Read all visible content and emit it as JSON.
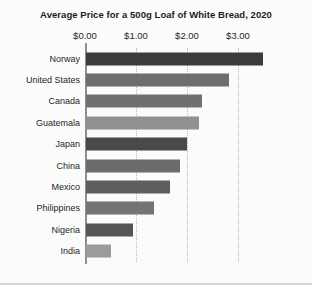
{
  "chart": {
    "title": "Average Price for a 500g Loaf of White Bread, 2020",
    "currency_prefix": "$"
  },
  "chart_data": {
    "type": "bar",
    "orientation": "horizontal",
    "title": "Average Price for a 500g Loaf of White Bread, 2020",
    "subtitle": "",
    "xlabel": "",
    "ylabel": "",
    "xlim": [
      0,
      3.5
    ],
    "xticks": [
      0,
      1,
      2,
      3
    ],
    "xtick_labels": [
      "$0.00",
      "$1.00",
      "$2.00",
      "$3.00"
    ],
    "grid": "vertical-dotted",
    "legend": "none",
    "categories": [
      "Norway",
      "United States",
      "Canada",
      "Guatemala",
      "Japan",
      "China",
      "Mexico",
      "Philippines",
      "Nigeria",
      "India"
    ],
    "values": [
      3.47,
      2.8,
      2.27,
      2.21,
      1.98,
      1.84,
      1.65,
      1.33,
      0.92,
      0.49
    ],
    "bar_colors": [
      "#3b3b3b",
      "#6e6e6e",
      "#707070",
      "#909090",
      "#494949",
      "#6b6b6b",
      "#5e5e5e",
      "#747474",
      "#555555",
      "#9b9b9b"
    ],
    "bars": [
      {
        "label": "Norway",
        "value": 3.47,
        "color": "#3b3b3b"
      },
      {
        "label": "United States",
        "value": 2.8,
        "color": "#6e6e6e"
      },
      {
        "label": "Canada",
        "value": 2.27,
        "color": "#707070"
      },
      {
        "label": "Guatemala",
        "value": 2.21,
        "color": "#909090"
      },
      {
        "label": "Japan",
        "value": 1.98,
        "color": "#494949"
      },
      {
        "label": "China",
        "value": 1.84,
        "color": "#6b6b6b"
      },
      {
        "label": "Mexico",
        "value": 1.65,
        "color": "#5e5e5e"
      },
      {
        "label": "Philippines",
        "value": 1.33,
        "color": "#747474"
      },
      {
        "label": "Nigeria",
        "value": 0.92,
        "color": "#555555"
      },
      {
        "label": "India",
        "value": 0.49,
        "color": "#9b9b9b"
      }
    ]
  },
  "colors": {
    "page_background": "#ececed",
    "plot_background": "#fbfbfb",
    "axis": "#8f8f8f",
    "gridline": "#b9b9b9",
    "text": "#1f1f1f"
  }
}
